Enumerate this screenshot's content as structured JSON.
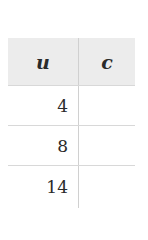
{
  "table": {
    "headers": [
      "u",
      "c"
    ],
    "rows": [
      {
        "u": "4",
        "c": ""
      },
      {
        "u": "8",
        "c": ""
      },
      {
        "u": "14",
        "c": ""
      }
    ]
  }
}
